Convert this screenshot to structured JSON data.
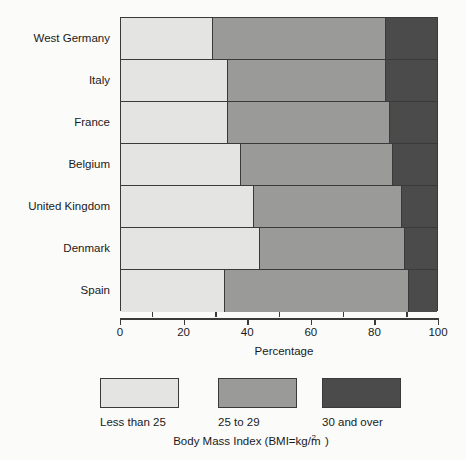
{
  "chart_data": {
    "type": "bar",
    "orientation": "horizontal",
    "stacked": true,
    "title": "",
    "xlabel": "Percentage",
    "ylabel": "",
    "xlim": [
      0,
      100
    ],
    "xticks": [
      0,
      10,
      20,
      30,
      40,
      50,
      60,
      70,
      80,
      90,
      100
    ],
    "xtick_labels": [
      "0",
      "20",
      "40",
      "60",
      "80",
      "100"
    ],
    "xtick_label_values": [
      0,
      20,
      40,
      60,
      80,
      100
    ],
    "grid": false,
    "legend_position": "bottom",
    "legend_caption": "Body Mass Index (BMI=kg/m2)",
    "categories": [
      "West Germany",
      "Italy",
      "France",
      "Belgium",
      "United Kingdom",
      "Denmark",
      "Spain"
    ],
    "series": [
      {
        "name": "Less than 25",
        "color": "#e4e4e2",
        "values": [
          29,
          34,
          34,
          38,
          42,
          44,
          33
        ]
      },
      {
        "name": "25 to 29",
        "color": "#9a9a98",
        "values": [
          55,
          50,
          51,
          48,
          47,
          46,
          58
        ]
      },
      {
        "name": "30 and over",
        "color": "#4b4b4b",
        "values": [
          16,
          16,
          15,
          14,
          11,
          10,
          9
        ]
      }
    ]
  },
  "axis": {
    "x_title": "Percentage",
    "tick_labels": [
      "0",
      "20",
      "40",
      "60",
      "80",
      "100"
    ]
  },
  "categories": [
    {
      "label": "West Germany"
    },
    {
      "label": "Italy"
    },
    {
      "label": "France"
    },
    {
      "label": "Belgium"
    },
    {
      "label": "United Kingdom"
    },
    {
      "label": "Denmark"
    },
    {
      "label": "Spain"
    }
  ],
  "legend": {
    "items": [
      {
        "label": "Less than 25",
        "color": "#e4e4e2"
      },
      {
        "label": "25 to 29",
        "color": "#9a9a98"
      },
      {
        "label": "30 and over",
        "color": "#4b4b4b"
      }
    ],
    "caption_prefix": "Body Mass Index (BMI=kg/m",
    "caption_sup": "2",
    "caption_suffix": ")"
  },
  "colors": {
    "light": "#e4e4e2",
    "medium": "#9a9a98",
    "dark": "#4b4b4b",
    "outline": "#3a3a3a",
    "background": "#fbfbfa",
    "text": "#1a1a1a"
  }
}
